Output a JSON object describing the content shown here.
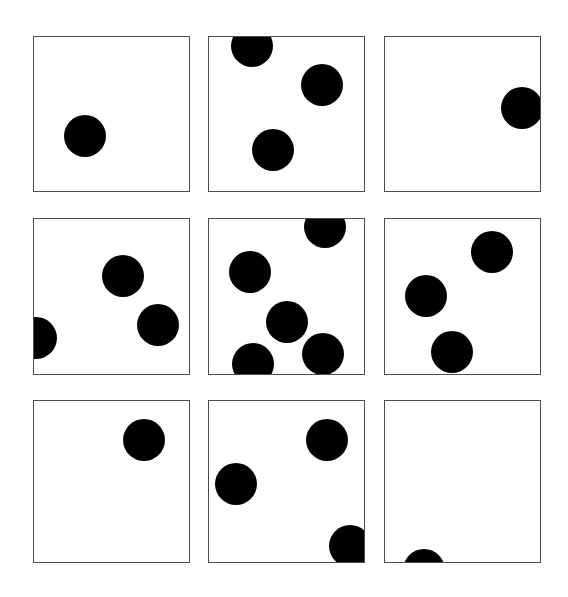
{
  "figure": {
    "background_color": "#ffffff",
    "border_color": "#4d4d4d",
    "dot_color": "#000000",
    "canvas_width": 568,
    "canvas_height": 597,
    "panel_count": 9,
    "rows": 3,
    "columns": 3,
    "dot_radius": 21
  },
  "chart_data": {
    "type": "scatter",
    "xlabel": "",
    "ylabel": "",
    "grid": false,
    "legend": null,
    "panel_layout": {
      "rows": 3,
      "cols": 3
    },
    "marker": {
      "shape": "circle",
      "color": "#000000",
      "radius_px": 21,
      "clipped_at_panel_bounds": true
    },
    "panels": [
      {
        "index": 1,
        "name": "panel-top-left",
        "row": 1,
        "col": 1,
        "bounds": {
          "x": 33,
          "y": 36,
          "w": 157,
          "h": 156
        },
        "dot_count": 1,
        "dots": [
          {
            "cx": 85,
            "cy": 136,
            "r": 21,
            "clipped": false
          }
        ]
      },
      {
        "index": 2,
        "name": "panel-top-middle",
        "row": 1,
        "col": 2,
        "bounds": {
          "x": 208,
          "y": 36,
          "w": 157,
          "h": 156
        },
        "dot_count": 3,
        "dots": [
          {
            "cx": 252,
            "cy": 46,
            "r": 21,
            "clipped": true
          },
          {
            "cx": 322,
            "cy": 85,
            "r": 21,
            "clipped": false
          },
          {
            "cx": 273,
            "cy": 150,
            "r": 21,
            "clipped": false
          }
        ]
      },
      {
        "index": 3,
        "name": "panel-top-right",
        "row": 1,
        "col": 3,
        "bounds": {
          "x": 384,
          "y": 36,
          "w": 157,
          "h": 156
        },
        "dot_count": 1,
        "dots": [
          {
            "cx": 522,
            "cy": 108,
            "r": 21,
            "clipped": true
          }
        ]
      },
      {
        "index": 4,
        "name": "panel-middle-left",
        "row": 2,
        "col": 1,
        "bounds": {
          "x": 33,
          "y": 218,
          "w": 157,
          "h": 157
        },
        "dot_count": 3,
        "dots": [
          {
            "cx": 123,
            "cy": 276,
            "r": 21,
            "clipped": false
          },
          {
            "cx": 158,
            "cy": 325,
            "r": 21,
            "clipped": false
          },
          {
            "cx": 36,
            "cy": 338,
            "r": 21,
            "clipped": true
          }
        ]
      },
      {
        "index": 5,
        "name": "panel-middle-center",
        "row": 2,
        "col": 2,
        "bounds": {
          "x": 208,
          "y": 218,
          "w": 157,
          "h": 157
        },
        "dot_count": 5,
        "dots": [
          {
            "cx": 325,
            "cy": 227,
            "r": 21,
            "clipped": true
          },
          {
            "cx": 250,
            "cy": 272,
            "r": 21,
            "clipped": false
          },
          {
            "cx": 287,
            "cy": 322,
            "r": 21,
            "clipped": false
          },
          {
            "cx": 323,
            "cy": 354,
            "r": 21,
            "clipped": false
          },
          {
            "cx": 253,
            "cy": 364,
            "r": 21,
            "clipped": true
          }
        ]
      },
      {
        "index": 6,
        "name": "panel-middle-right",
        "row": 2,
        "col": 3,
        "bounds": {
          "x": 384,
          "y": 218,
          "w": 157,
          "h": 157
        },
        "dot_count": 3,
        "dots": [
          {
            "cx": 492,
            "cy": 252,
            "r": 21,
            "clipped": false
          },
          {
            "cx": 426,
            "cy": 296,
            "r": 21,
            "clipped": false
          },
          {
            "cx": 452,
            "cy": 352,
            "r": 21,
            "clipped": false
          }
        ]
      },
      {
        "index": 7,
        "name": "panel-bottom-left",
        "row": 3,
        "col": 1,
        "bounds": {
          "x": 33,
          "y": 400,
          "w": 157,
          "h": 163
        },
        "dot_count": 1,
        "dots": [
          {
            "cx": 144,
            "cy": 440,
            "r": 21,
            "clipped": false
          }
        ]
      },
      {
        "index": 8,
        "name": "panel-bottom-middle",
        "row": 3,
        "col": 2,
        "bounds": {
          "x": 208,
          "y": 400,
          "w": 157,
          "h": 163
        },
        "dot_count": 3,
        "dots": [
          {
            "cx": 327,
            "cy": 440,
            "r": 21,
            "clipped": false
          },
          {
            "cx": 236,
            "cy": 484,
            "r": 21,
            "clipped": false
          },
          {
            "cx": 350,
            "cy": 546,
            "r": 21,
            "clipped": true
          }
        ]
      },
      {
        "index": 9,
        "name": "panel-bottom-right",
        "row": 3,
        "col": 3,
        "bounds": {
          "x": 384,
          "y": 400,
          "w": 157,
          "h": 163
        },
        "dot_count": 1,
        "dots": [
          {
            "cx": 424,
            "cy": 570,
            "r": 21,
            "clipped": true
          }
        ]
      }
    ]
  }
}
